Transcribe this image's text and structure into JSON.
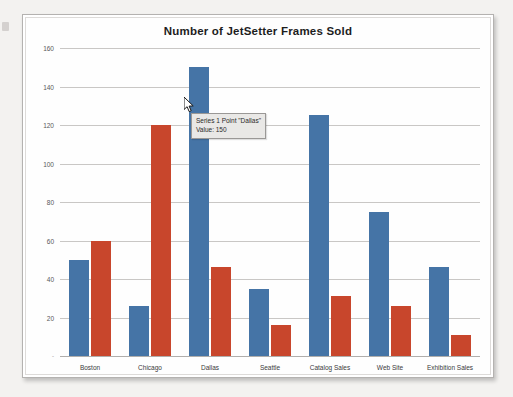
{
  "chart_data": {
    "type": "bar",
    "title": "Number of JetSetter Frames Sold",
    "xlabel": "",
    "ylabel": "",
    "ylim": [
      0,
      160
    ],
    "ytick_step": 20,
    "yticks": [
      "0",
      "20",
      "40",
      "60",
      "80",
      "100",
      "120",
      "140",
      "160"
    ],
    "grid": true,
    "legend": "none",
    "categories": [
      "Boston",
      "Chicago",
      "Dallas",
      "Seattle",
      "Catalog Sales",
      "Web Site",
      "Exhibition Sales"
    ],
    "series": [
      {
        "name": "Series 1",
        "color": "#4574a6",
        "values": [
          50,
          26,
          150,
          35,
          125,
          75,
          46
        ]
      },
      {
        "name": "Series 2",
        "color": "#c8462c",
        "values": [
          60,
          120,
          46,
          16,
          31,
          26,
          11
        ]
      }
    ]
  },
  "tooltip": {
    "line1": "Series 1 Point \"Dallas\"",
    "line2": "Value:  150"
  },
  "colors": {
    "series1": "#4574a6",
    "series2": "#c8462c",
    "grid": "#c9c7c5",
    "tooltip_bg": "#e9e8e6"
  }
}
